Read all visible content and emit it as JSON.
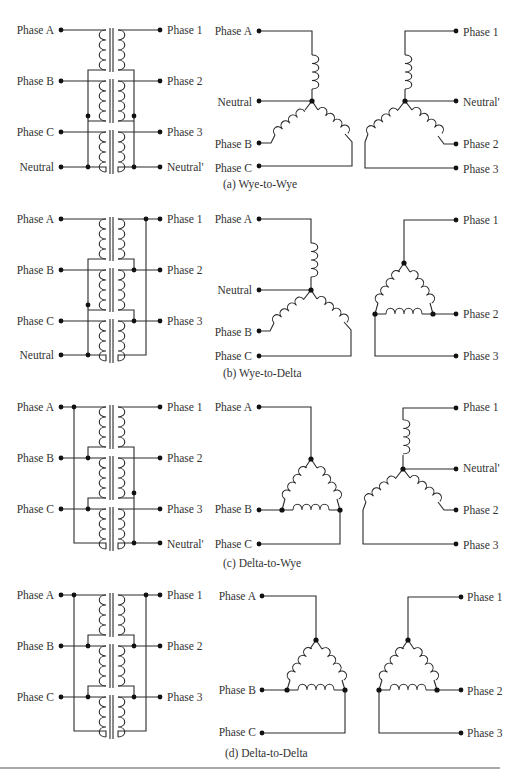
{
  "figure": {
    "panels": [
      {
        "id": "a",
        "caption": "(a) Wye-to-Wye",
        "transformer_bank": {
          "left_labels": [
            "Phase A",
            "Phase B",
            "Phase C",
            "Neutral"
          ],
          "right_labels": [
            "Phase 1",
            "Phase 2",
            "Phase 3",
            "Neutral'"
          ]
        },
        "schematic": {
          "primary_type": "wye",
          "secondary_type": "wye",
          "left_labels": [
            "Phase A",
            "Neutral",
            "Phase B",
            "Phase C"
          ],
          "right_labels": [
            "Phase 1",
            "Neutral'",
            "Phase 2",
            "Phase 3"
          ]
        }
      },
      {
        "id": "b",
        "caption": "(b) Wye-to-Delta",
        "transformer_bank": {
          "left_labels": [
            "Phase A",
            "Phase B",
            "Phase C",
            "Neutral"
          ],
          "right_labels": [
            "Phase 1",
            "Phase 2",
            "Phase 3"
          ]
        },
        "schematic": {
          "primary_type": "wye",
          "secondary_type": "delta",
          "left_labels": [
            "Phase A",
            "Neutral",
            "Phase B",
            "Phase C"
          ],
          "right_labels": [
            "Phase 1",
            "Phase 2",
            "Phase 3"
          ]
        }
      },
      {
        "id": "c",
        "caption": "(c) Delta-to-Wye",
        "transformer_bank": {
          "left_labels": [
            "Phase A",
            "Phase B",
            "Phase C"
          ],
          "right_labels": [
            "Phase 1",
            "Phase 2",
            "Phase 3",
            "Neutral'"
          ]
        },
        "schematic": {
          "primary_type": "delta",
          "secondary_type": "wye",
          "left_labels": [
            "Phase A",
            "Phase B",
            "Phase C"
          ],
          "right_labels": [
            "Phase 1",
            "Neutral'",
            "Phase 2",
            "Phase 3"
          ]
        }
      },
      {
        "id": "d",
        "caption": "(d) Delta-to-Delta",
        "transformer_bank": {
          "left_labels": [
            "Phase A",
            "Phase B",
            "Phase C"
          ],
          "right_labels": [
            "Phase 1",
            "Phase 2",
            "Phase 3"
          ]
        },
        "schematic": {
          "primary_type": "delta",
          "secondary_type": "delta",
          "left_labels": [
            "Phase A",
            "Phase B",
            "Phase C"
          ],
          "right_labels": [
            "Phase 1",
            "Phase 2",
            "Phase 3"
          ]
        }
      }
    ]
  }
}
